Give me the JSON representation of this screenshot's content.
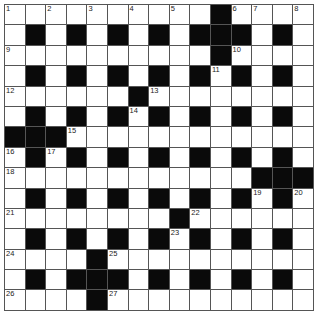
{
  "puzzle": {
    "type": "crossword",
    "size": {
      "rows": 15,
      "cols": 15
    },
    "colors": {
      "black": "#0a0a0a",
      "white": "#ffffff",
      "lines": "#555555"
    },
    "grid": [
      "1.2.3.4.5.#67.8",
      ".#.#.#.#.###.#.",
      "9.........#10...",
      ".#.#.#.#.#11#.#.",
      "12.....#13.......",
      ".#.#.#14#.#.#.#.",
      "###15...........",
      "16#17#.#.#.#.#.#.",
      "18...........###",
      ".#.#.#.#.#.#19#20",
      "21.......#22.....",
      ".#.#.#.#23#.#.#.",
      "24...#25.........",
      ".#.###.#.#.#.#.",
      "26...#27........."
    ],
    "cells": [
      [
        "1",
        "",
        "2",
        "",
        "3",
        "",
        "4",
        "",
        "5",
        "",
        "#",
        "6",
        "7",
        "",
        "8"
      ],
      [
        "",
        "#",
        "",
        "#",
        "",
        "#",
        "",
        "#",
        "",
        "#",
        "#",
        "#",
        "",
        "#",
        ""
      ],
      [
        "9",
        "",
        "",
        "",
        "",
        "",
        "",
        "",
        "",
        "",
        "#",
        "10",
        "",
        "",
        ""
      ],
      [
        "",
        "#",
        "",
        "#",
        "",
        "#",
        "",
        "#",
        "",
        "#",
        "11",
        "#",
        "",
        "#",
        ""
      ],
      [
        "12",
        "",
        "",
        "",
        "",
        "",
        "#",
        "13",
        "",
        "",
        "",
        "",
        "",
        "",
        ""
      ],
      [
        "",
        "#",
        "",
        "#",
        "",
        "#",
        "14",
        "#",
        "",
        "#",
        "",
        "#",
        "",
        "#",
        ""
      ],
      [
        "#",
        "#",
        "#",
        "15",
        "",
        "",
        "",
        "",
        "",
        "",
        "",
        "",
        "",
        "",
        ""
      ],
      [
        "16",
        "#",
        "17",
        "#",
        "",
        "#",
        "",
        "#",
        "",
        "#",
        "",
        "#",
        "",
        "#",
        ""
      ],
      [
        "18",
        "",
        "",
        "",
        "",
        "",
        "",
        "",
        "",
        "",
        "",
        "",
        "#",
        "#",
        "#"
      ],
      [
        "",
        "#",
        "",
        "#",
        "",
        "#",
        "",
        "#",
        "",
        "#",
        "",
        "#",
        "19",
        "#",
        "20"
      ],
      [
        "21",
        "",
        "",
        "",
        "",
        "",
        "",
        "",
        "#",
        "22",
        "",
        "",
        "",
        "",
        ""
      ],
      [
        "",
        "#",
        "",
        "#",
        "",
        "#",
        "",
        "#",
        "23",
        "#",
        "",
        "#",
        "",
        "#",
        ""
      ],
      [
        "24",
        "",
        "",
        "",
        "#",
        "25",
        "",
        "",
        "",
        "",
        "",
        "",
        "",
        "",
        ""
      ],
      [
        "",
        "#",
        "",
        "#",
        "#",
        "#",
        "",
        "#",
        "",
        "#",
        "",
        "#",
        "",
        "#",
        ""
      ],
      [
        "26",
        "",
        "",
        "",
        "#",
        "27",
        "",
        "",
        "",
        "",
        "",
        "",
        "",
        "",
        ""
      ]
    ],
    "clue_numbers": [
      "1",
      "2",
      "3",
      "4",
      "5",
      "6",
      "7",
      "8",
      "9",
      "10",
      "11",
      "12",
      "13",
      "14",
      "15",
      "16",
      "17",
      "18",
      "19",
      "20",
      "21",
      "22",
      "23",
      "24",
      "25",
      "26",
      "27"
    ]
  }
}
